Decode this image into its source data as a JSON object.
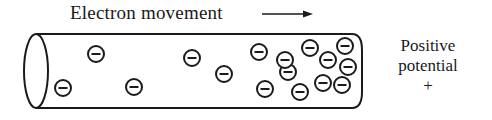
{
  "diagram": {
    "title": "Electron movement",
    "arrow_direction": "right",
    "right_label": {
      "line1": "Positive",
      "line2": "potential",
      "line3": "+"
    },
    "conductor": {
      "shape": "cylinder",
      "left_end": "open-ellipse",
      "right_end": "rounded-closed"
    },
    "electron_symbol": "⊖",
    "electrons": [
      {
        "x": 63,
        "y": 88
      },
      {
        "x": 96,
        "y": 54
      },
      {
        "x": 134,
        "y": 87
      },
      {
        "x": 192,
        "y": 58
      },
      {
        "x": 224,
        "y": 74
      },
      {
        "x": 259,
        "y": 52
      },
      {
        "x": 265,
        "y": 89
      },
      {
        "x": 288,
        "y": 72
      },
      {
        "x": 310,
        "y": 48
      },
      {
        "x": 328,
        "y": 60
      },
      {
        "x": 345,
        "y": 46
      },
      {
        "x": 348,
        "y": 67
      },
      {
        "x": 323,
        "y": 83
      },
      {
        "x": 342,
        "y": 85
      },
      {
        "x": 300,
        "y": 92
      },
      {
        "x": 285,
        "y": 60
      }
    ],
    "colors": {
      "ink": "#1a1a1a",
      "background": "#ffffff"
    }
  }
}
